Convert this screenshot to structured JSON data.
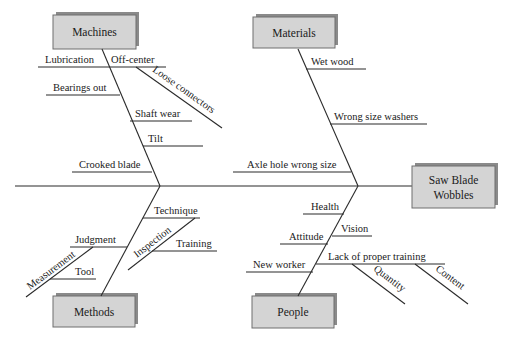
{
  "diagram": {
    "type": "fishbone",
    "effect": {
      "line1": "Saw Blade",
      "line2": "Wobbles"
    },
    "categories": {
      "machines": {
        "label": "Machines",
        "causes": [
          "Lubrication",
          "Off-center",
          "Loose connectors",
          "Bearings out",
          "Shaft wear",
          "Tilt",
          "Crooked blade"
        ]
      },
      "materials": {
        "label": "Materials",
        "causes": [
          "Wet wood",
          "Wrong size washers",
          "Axle hole wrong size"
        ]
      },
      "methods": {
        "label": "Methods",
        "causes": [
          "Technique",
          "Inspection",
          "Training",
          "Judgment",
          "Measurement",
          "Tool"
        ]
      },
      "people": {
        "label": "People",
        "causes": [
          "Health",
          "Vision",
          "Attitude",
          "Lack of proper training",
          "New worker",
          "Quantity",
          "Content"
        ]
      }
    }
  }
}
